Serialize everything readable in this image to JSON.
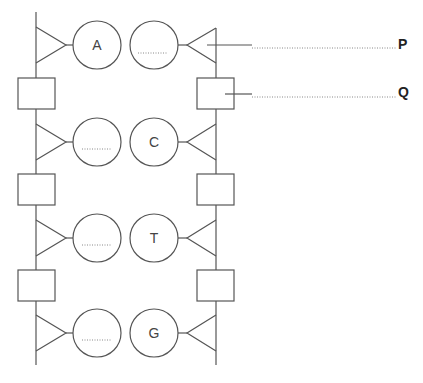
{
  "diagram": {
    "labels": {
      "P": "P",
      "Q": "Q"
    },
    "left_strand": {
      "bases": [
        "A",
        "",
        "",
        ""
      ]
    },
    "right_strand": {
      "bases": [
        "",
        "C",
        "T",
        "G"
      ]
    },
    "blank_placeholder": "......",
    "colors": {
      "line": "#555555",
      "text": "#444444",
      "label": "#222222"
    }
  }
}
